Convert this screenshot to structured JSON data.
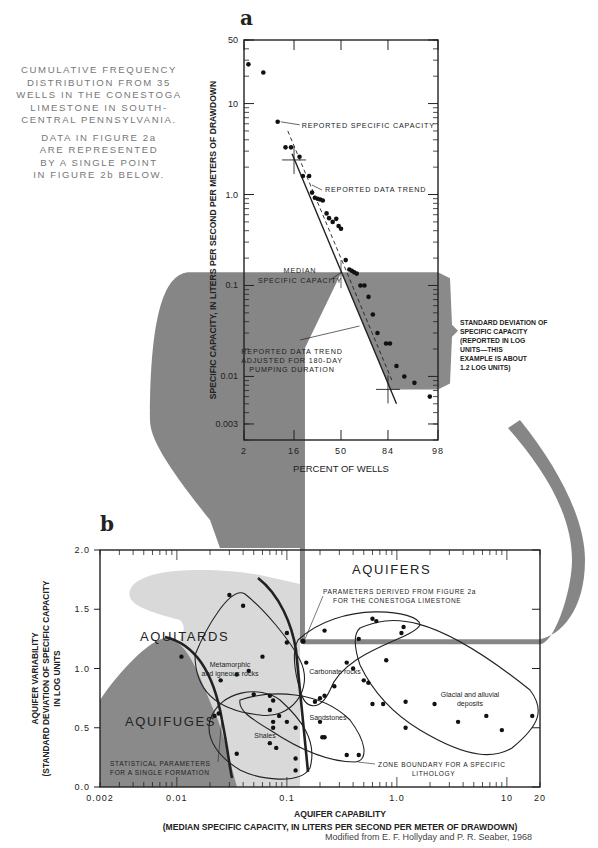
{
  "caption": {
    "lines_a": [
      "CUMULATIVE FREQUENCY",
      "DISTRIBUTION FROM 35",
      "WELLS IN THE CONESTOGA",
      "LIMESTONE IN SOUTH-",
      "CENTRAL PENNSYLVANIA."
    ],
    "lines_b": [
      "DATA IN FIGURE 2a",
      "ARE REPRESENTED",
      "BY A SINGLE POINT",
      "IN FIGURE 2b BELOW."
    ]
  },
  "credit": "Modified from E. F. Hollyday and P. R. Seaber, 1968",
  "colors": {
    "dark_shade": "#8a8a8a",
    "light_shade": "#d9d9d9",
    "connector": "#7f7f7f",
    "ink": "#222222"
  },
  "chart_data": [
    {
      "panel": "a",
      "type": "scatter",
      "title": "",
      "xlabel": "PERCENT OF WELLS",
      "ylabel": "SPECIFIC CAPACITY, IN LITERS PER SECOND PER METERS OF DRAWDOWN",
      "x_scale": "probability",
      "y_scale": "log",
      "xlim": [
        2,
        98
      ],
      "ylim": [
        0.002,
        50
      ],
      "x_ticks": [
        "2",
        "16",
        "50",
        "84",
        "98"
      ],
      "y_ticks": [
        "50",
        "10",
        "1.0",
        "0.1",
        "0.01",
        "0.003"
      ],
      "grid": false,
      "points": [
        {
          "x": 2.5,
          "y": 27
        },
        {
          "x": 5,
          "y": 22
        },
        {
          "x": 9,
          "y": 6.3
        },
        {
          "x": 12,
          "y": 3.3
        },
        {
          "x": 14.5,
          "y": 3.3
        },
        {
          "x": 19,
          "y": 2.6
        },
        {
          "x": 21,
          "y": 1.6
        },
        {
          "x": 25,
          "y": 1.6
        },
        {
          "x": 27,
          "y": 1.05
        },
        {
          "x": 29,
          "y": 0.92
        },
        {
          "x": 31,
          "y": 0.9
        },
        {
          "x": 33,
          "y": 0.88
        },
        {
          "x": 35,
          "y": 0.86
        },
        {
          "x": 38,
          "y": 0.62
        },
        {
          "x": 40,
          "y": 0.55
        },
        {
          "x": 43,
          "y": 0.5
        },
        {
          "x": 46,
          "y": 0.54
        },
        {
          "x": 48,
          "y": 0.45
        },
        {
          "x": 50,
          "y": 0.42
        },
        {
          "x": 54,
          "y": 0.19
        },
        {
          "x": 57,
          "y": 0.15
        },
        {
          "x": 59,
          "y": 0.145
        },
        {
          "x": 61,
          "y": 0.14
        },
        {
          "x": 63,
          "y": 0.135
        },
        {
          "x": 66,
          "y": 0.1
        },
        {
          "x": 69,
          "y": 0.1
        },
        {
          "x": 72,
          "y": 0.075
        },
        {
          "x": 75,
          "y": 0.048
        },
        {
          "x": 78,
          "y": 0.03
        },
        {
          "x": 83,
          "y": 0.023
        },
        {
          "x": 85,
          "y": 0.023
        },
        {
          "x": 88,
          "y": 0.013
        },
        {
          "x": 91,
          "y": 0.01
        },
        {
          "x": 94,
          "y": 0.0085
        },
        {
          "x": 97,
          "y": 0.006
        }
      ],
      "lines": [
        {
          "name": "REPORTED DATA TREND",
          "style": "dashed",
          "from": {
            "x": 13,
            "y": 5.0
          },
          "to": {
            "x": 86,
            "y": 0.009
          }
        },
        {
          "name": "REPORTED DATA TREND ADJUSTED FOR 180-DAY PUMPING DURATION",
          "style": "solid",
          "from": {
            "x": 15,
            "y": 2.8
          },
          "to": {
            "x": 88,
            "y": 0.005
          }
        }
      ],
      "markers": [
        {
          "name": "median-cross",
          "x": 16,
          "y": 2.4
        },
        {
          "name": "sd-cross",
          "x": 84,
          "y": 0.0072
        }
      ],
      "shaded_region": {
        "y_top": 0.14,
        "y_bottom": 0.0072,
        "label": "STANDARD DEVIATION OF SPECIFIC CAPACITY"
      },
      "annotations": [
        "REPORTED SPECIFIC CAPACITY",
        "REPORTED DATA TREND",
        "MEDIAN SPECIFIC CAPACITY",
        "REPORTED DATA TREND ADJUSTED FOR 180-DAY PUMPING DURATION"
      ],
      "side_note": [
        "STANDARD DEVIATION OF",
        "SPECIFIC CAPACITY",
        "(REPORTED IN LOG",
        "UNITS—THIS",
        "EXAMPLE IS ABOUT",
        "1.2 LOG UNITS)"
      ],
      "median_specific_capacity": 0.14,
      "standard_deviation_log_units": 1.2
    },
    {
      "panel": "b",
      "type": "scatter",
      "title": "",
      "xlabel": "AQUIFER CAPABILITY",
      "xlabel_sub": "(MEDIAN SPECIFIC CAPACITY, IN LITERS PER SECOND PER METER OF DRAWDOWN)",
      "ylabel_lines": [
        "AQUIFER VARIABILITY",
        "(STANDARD DEVIATION OF SPECIFIC CAPACITY",
        "IN LOG UNITS"
      ],
      "x_scale": "log",
      "y_scale": "linear",
      "xlim": [
        0.002,
        20
      ],
      "ylim": [
        0.0,
        2.0
      ],
      "x_ticks": [
        "0.002",
        "0.01",
        "0.1",
        "1.0",
        "10",
        "20"
      ],
      "y_ticks": [
        "0.0",
        "0.5",
        "1.0",
        "1.5",
        "2.0"
      ],
      "grid": false,
      "zones": [
        {
          "name": "AQUITARDS",
          "shade": "light"
        },
        {
          "name": "AQUIFUGES",
          "shade": "dark"
        },
        {
          "name": "AQUIFERS",
          "shade": "none"
        }
      ],
      "groups": [
        {
          "name": "Metamorphic and igneous rocks",
          "points": [
            [
              0.011,
              1.1
            ],
            [
              0.03,
              1.62
            ],
            [
              0.04,
              1.53
            ],
            [
              0.1,
              1.3
            ],
            [
              0.1,
              1.22
            ],
            [
              0.06,
              1.1
            ],
            [
              0.045,
              0.98
            ],
            [
              0.035,
              0.95
            ],
            [
              0.025,
              0.9
            ]
          ]
        },
        {
          "name": "Carbonate rocks",
          "points": [
            [
              0.22,
              1.32
            ],
            [
              0.6,
              1.42
            ],
            [
              0.65,
              1.4
            ],
            [
              0.15,
              1.05
            ],
            [
              0.35,
              1.05
            ],
            [
              0.4,
              1.0
            ],
            [
              0.5,
              0.9
            ],
            [
              0.27,
              0.85
            ],
            [
              0.6,
              0.7
            ],
            [
              0.75,
              0.7
            ],
            [
              1.2,
              0.72
            ]
          ]
        },
        {
          "name": "Glacial and alluvial deposits",
          "points": [
            [
              0.45,
              1.25
            ],
            [
              1.1,
              1.3
            ],
            [
              1.15,
              1.35
            ],
            [
              0.8,
              1.07
            ],
            [
              0.55,
              0.88
            ],
            [
              1.2,
              0.5
            ],
            [
              2.2,
              0.7
            ],
            [
              3.6,
              0.55
            ],
            [
              6.5,
              0.6
            ],
            [
              9,
              0.48
            ],
            [
              17,
              0.6
            ]
          ]
        },
        {
          "name": "Sandstones",
          "points": [
            [
              0.18,
              0.72
            ],
            [
              0.2,
              0.75
            ],
            [
              0.22,
              0.77
            ],
            [
              0.2,
              0.55
            ],
            [
              0.21,
              0.42
            ],
            [
              0.22,
              0.42
            ],
            [
              0.35,
              0.27
            ],
            [
              0.45,
              0.27
            ]
          ]
        },
        {
          "name": "Shales",
          "points": [
            [
              0.022,
              0.6
            ],
            [
              0.024,
              0.62
            ],
            [
              0.05,
              0.78
            ],
            [
              0.07,
              0.77
            ],
            [
              0.075,
              0.73
            ],
            [
              0.07,
              0.65
            ],
            [
              0.085,
              0.6
            ],
            [
              0.075,
              0.55
            ],
            [
              0.075,
              0.5
            ],
            [
              0.1,
              0.55
            ],
            [
              0.12,
              0.5
            ],
            [
              0.07,
              0.37
            ],
            [
              0.08,
              0.33
            ],
            [
              0.12,
              0.24
            ],
            [
              0.12,
              0.14
            ],
            [
              0.035,
              0.28
            ]
          ]
        }
      ],
      "highlight_point": {
        "name": "PARAMETERS DERIVED FROM FIGURE 2a FOR THE CONESTOGA LIMESTONE",
        "x": 0.14,
        "y": 1.23
      },
      "annotations": [
        "PARAMETERS DERIVED FROM FIGURE 2a",
        "FOR THE CONESTOGA LIMESTONE",
        "ZONE BOUNDARY FOR A SPECIFIC",
        "LITHOLOGY",
        "STATISTICAL PARAMETERS",
        "FOR A SINGLE FORMATION"
      ]
    }
  ]
}
